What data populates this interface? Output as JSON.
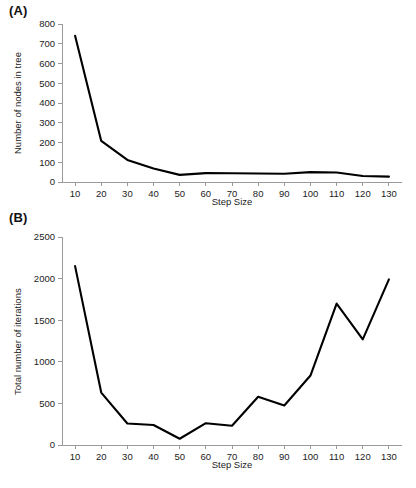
{
  "figure": {
    "panel_a_label": "(A)",
    "panel_b_label": "(B)"
  },
  "chart_data": [
    {
      "id": "panel-a",
      "type": "line",
      "title": "",
      "panel": "(A)",
      "xlabel": "Step Size",
      "ylabel": "Number of nodes in tree",
      "x": [
        10,
        20,
        30,
        40,
        50,
        60,
        70,
        80,
        90,
        100,
        110,
        120,
        130
      ],
      "values": [
        740,
        208,
        112,
        68,
        36,
        45,
        44,
        43,
        42,
        50,
        48,
        30,
        27
      ],
      "xticks": [
        "10",
        "20",
        "30",
        "40",
        "50",
        "60",
        "70",
        "80",
        "90",
        "100",
        "110",
        "120",
        "130"
      ],
      "yticks": [
        "0",
        "100",
        "200",
        "300",
        "400",
        "500",
        "600",
        "700",
        "800"
      ],
      "ytickvals": [
        0,
        100,
        200,
        300,
        400,
        500,
        600,
        700,
        800
      ],
      "xlim": [
        5,
        135
      ],
      "ylim": [
        0,
        800
      ],
      "grid": false,
      "legend": false,
      "line_color": "#000000"
    },
    {
      "id": "panel-b",
      "type": "line",
      "title": "",
      "panel": "(B)",
      "xlabel": "Step Size",
      "ylabel": "Total number of iterations",
      "x": [
        10,
        20,
        30,
        40,
        50,
        60,
        70,
        80,
        90,
        100,
        110,
        120,
        130
      ],
      "values": [
        2150,
        630,
        258,
        240,
        75,
        262,
        232,
        580,
        475,
        835,
        1700,
        1270,
        1990
      ],
      "xticks": [
        "10",
        "20",
        "30",
        "40",
        "50",
        "60",
        "70",
        "80",
        "90",
        "100",
        "110",
        "120",
        "130"
      ],
      "yticks": [
        "0",
        "500",
        "1000",
        "1500",
        "2000",
        "2500"
      ],
      "ytickvals": [
        0,
        500,
        1000,
        1500,
        2000,
        2500
      ],
      "xlim": [
        5,
        135
      ],
      "ylim": [
        0,
        2500
      ],
      "grid": false,
      "legend": false,
      "line_color": "#000000"
    }
  ]
}
